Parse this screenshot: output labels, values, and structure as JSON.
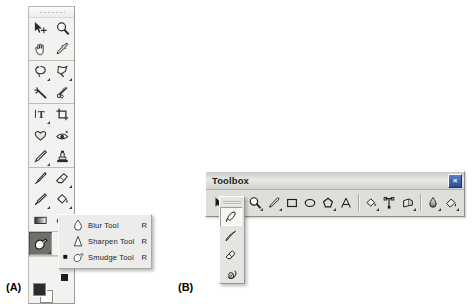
{
  "figure": {
    "label_a": "(A)",
    "label_b": "(B)"
  },
  "palette_a": {
    "name": "tool-palette",
    "grip": "drag-grip",
    "groups": [
      {
        "tools": [
          {
            "id": "move-tool",
            "icon": "move-arrow-icon",
            "has_flyout": false
          },
          {
            "id": "zoom-tool",
            "icon": "magnifier-icon",
            "has_flyout": false
          },
          {
            "id": "hand-tool",
            "icon": "hand-icon",
            "has_flyout": false
          },
          {
            "id": "eyedropper-tool",
            "icon": "eyedropper-icon",
            "has_flyout": false
          }
        ]
      },
      {
        "tools": [
          {
            "id": "lasso-tool",
            "icon": "lasso-icon",
            "has_flyout": true
          },
          {
            "id": "free-select-tool",
            "icon": "polygon-lasso-icon",
            "has_flyout": true
          },
          {
            "id": "magic-wand-tool",
            "icon": "magic-wand-icon",
            "has_flyout": false
          },
          {
            "id": "scissors-tool",
            "icon": "scissors-icon",
            "has_flyout": false
          }
        ]
      },
      {
        "tools": [
          {
            "id": "text-tool",
            "icon": "text-t-icon",
            "has_flyout": true
          },
          {
            "id": "crop-tool",
            "icon": "crop-icon",
            "has_flyout": false
          },
          {
            "id": "shape-tool",
            "icon": "heart-shape-icon",
            "has_flyout": false
          },
          {
            "id": "red-eye-tool",
            "icon": "red-eye-icon",
            "has_flyout": false
          },
          {
            "id": "pencil-tool",
            "icon": "pencil-icon",
            "has_flyout": true
          },
          {
            "id": "clone-stamp-tool",
            "icon": "stamp-icon",
            "has_flyout": false
          }
        ]
      },
      {
        "tools": [
          {
            "id": "paintbrush-tool",
            "icon": "paintbrush-icon",
            "has_flyout": false
          },
          {
            "id": "eraser-tool",
            "icon": "eraser-icon",
            "has_flyout": true
          },
          {
            "id": "airbrush-tool",
            "icon": "airbrush-icon",
            "has_flyout": true
          },
          {
            "id": "paint-bucket-tool",
            "icon": "paint-bucket-icon",
            "has_flyout": true
          },
          {
            "id": "gradient-tool",
            "icon": "gradient-icon",
            "has_flyout": false
          },
          {
            "id": "blur-group-tool",
            "icon": "blur-drop-icon",
            "has_flyout": true
          }
        ]
      }
    ],
    "selected_tool": {
      "id": "smudge-tool",
      "icon": "smudge-finger-icon",
      "selected": true
    },
    "swatches": {
      "foreground_color": "#2b2b2b",
      "background_color": "#ffffff",
      "mode_indicator": "quick-mask-indicator"
    }
  },
  "flyout_a": {
    "name": "blur-tool-flyout-menu",
    "items": [
      {
        "icon": "water-drop-icon",
        "label": "Blur Tool",
        "shortcut": "R",
        "checked": false
      },
      {
        "icon": "sharpen-triangle-icon",
        "label": "Sharpen Tool",
        "shortcut": "R",
        "checked": false
      },
      {
        "icon": "smudge-finger-icon",
        "label": "Smudge Tool",
        "shortcut": "R",
        "checked": true
      }
    ],
    "check_glyph": "■"
  },
  "toolbox_b": {
    "title": "Toolbox",
    "close_label": "×",
    "toolbar": {
      "groups": [
        {
          "tools": [
            {
              "id": "select-arrow-tool",
              "icon": "arrow-pointer-icon",
              "has_flyout": false
            },
            {
              "id": "pen-tool",
              "icon": "pen-nib-icon",
              "has_flyout": true
            },
            {
              "id": "zoom-tool",
              "icon": "magnifier-icon",
              "has_flyout": true
            },
            {
              "id": "freehand-tool",
              "icon": "pencil-icon",
              "has_flyout": true
            },
            {
              "id": "rectangle-tool",
              "icon": "rectangle-icon",
              "has_flyout": false
            },
            {
              "id": "ellipse-tool",
              "icon": "ellipse-icon",
              "has_flyout": false
            },
            {
              "id": "polygon-tool",
              "icon": "polygon-icon",
              "has_flyout": true
            },
            {
              "id": "text-tool",
              "icon": "text-a-icon",
              "has_flyout": false
            }
          ]
        },
        {
          "tools": [
            {
              "id": "fill-tool",
              "icon": "paint-bucket-icon",
              "has_flyout": true
            },
            {
              "id": "node-tool",
              "icon": "node-edit-icon",
              "has_flyout": false
            },
            {
              "id": "perspective-tool",
              "icon": "perspective-cube-icon",
              "has_flyout": true
            }
          ]
        },
        {
          "tools": [
            {
              "id": "gradient-tool",
              "icon": "gradient-drop-icon",
              "has_flyout": true
            },
            {
              "id": "color-fill-tool",
              "icon": "color-pour-icon",
              "has_flyout": true
            }
          ]
        }
      ]
    },
    "flyout": {
      "name": "pen-tool-flyout",
      "grip": "flyout-grip",
      "items": [
        {
          "id": "pen-nib-tool",
          "icon": "pen-nib-icon",
          "selected": true
        },
        {
          "id": "calligraphy-tool",
          "icon": "calligraphy-pen-icon",
          "selected": false
        },
        {
          "id": "eraser-tool",
          "icon": "eraser-icon",
          "selected": false
        },
        {
          "id": "spiral-tool",
          "icon": "spiral-icon",
          "selected": false
        }
      ]
    }
  }
}
